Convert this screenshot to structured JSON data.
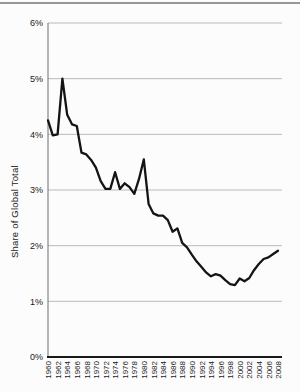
{
  "page": {
    "background": "#fcfcfc",
    "top_rule_color": "#979797"
  },
  "chart_data": {
    "type": "line",
    "title": "",
    "xlabel": "",
    "ylabel": "Share of Global Total",
    "ylim": [
      0,
      6
    ],
    "yticks": [
      0,
      1,
      2,
      3,
      4,
      5,
      6
    ],
    "ytick_labels": [
      "0%",
      "1%",
      "2%",
      "3%",
      "4%",
      "5%",
      "6%"
    ],
    "xtick_labels": [
      "1960",
      "1962",
      "1964",
      "1966",
      "1968",
      "1970",
      "1972",
      "1974",
      "1976",
      "1978",
      "1980",
      "1982",
      "1984",
      "1986",
      "1988",
      "1990",
      "1992",
      "1994",
      "1996",
      "1998",
      "2000",
      "2002",
      "2004",
      "2006",
      "2008"
    ],
    "grid": "horizontal",
    "legend": "none",
    "line_color": "#141414",
    "grid_color": "#a9a9a9",
    "axis_color": "#1a1a1a",
    "y_axis_line_color": "#6e6e6e",
    "x": [
      1960,
      1961,
      1962,
      1963,
      1964,
      1965,
      1966,
      1967,
      1968,
      1969,
      1970,
      1971,
      1972,
      1973,
      1974,
      1975,
      1976,
      1977,
      1978,
      1979,
      1980,
      1981,
      1982,
      1983,
      1984,
      1985,
      1986,
      1987,
      1988,
      1989,
      1990,
      1991,
      1992,
      1993,
      1994,
      1995,
      1996,
      1997,
      1998,
      1999,
      2000,
      2001,
      2002,
      2003,
      2004,
      2005,
      2006,
      2007,
      2008
    ],
    "values": [
      4.25,
      3.98,
      4.0,
      5.0,
      4.35,
      4.18,
      4.15,
      3.67,
      3.64,
      3.54,
      3.4,
      3.16,
      3.02,
      3.02,
      3.32,
      3.02,
      3.12,
      3.05,
      2.93,
      3.2,
      3.55,
      2.75,
      2.58,
      2.54,
      2.54,
      2.46,
      2.25,
      2.31,
      2.05,
      1.97,
      1.84,
      1.72,
      1.62,
      1.52,
      1.45,
      1.49,
      1.46,
      1.38,
      1.31,
      1.29,
      1.41,
      1.36,
      1.42,
      1.56,
      1.67,
      1.76,
      1.79,
      1.85,
      1.91
    ]
  }
}
